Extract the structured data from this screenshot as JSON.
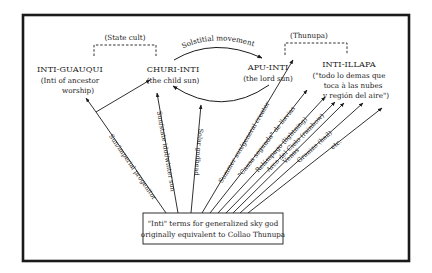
{
  "diagram": {
    "nodes": {
      "inti_guauqui": {
        "title": "INTI-GUAUQUI",
        "sub1": "(Inti of ancestor",
        "sub2": "worship)"
      },
      "churi_inti": {
        "title": "CHURI-INTI",
        "sub1": "(the child sun)"
      },
      "apu_inti": {
        "title": "APU-INTI",
        "sub1": "(the lord sun)"
      },
      "inti_illapa": {
        "title": "INTI-ILLAPA",
        "sub1": "(\"todo lo demas que",
        "sub2": "toca à las nubes",
        "sub3": "y región del aire\")"
      }
    },
    "brackets": {
      "state_cult": "(State cult)",
      "thunupa": "(Thunupa)"
    },
    "cycle_label": "Solstitial movement",
    "rays": [
      {
        "label": "Sun/imperial progenitor"
      },
      {
        "label": "Sun/state idol/winter sun"
      },
      {
        "label": "Solar godhead"
      },
      {
        "label": "Summer sun/general creator"
      },
      {
        "label": "\"Causa segunda\" de lluvias"
      },
      {
        "label": "Relámpago (lightning)"
      },
      {
        "label": "Arco del Cielo (rainbow)"
      },
      {
        "label": "Venus"
      },
      {
        "label": "Granizo (hail)"
      },
      {
        "label": "etc."
      }
    ],
    "base_box": {
      "line1": "\"Inti\" terms for generalized sky god",
      "line2": "originally equivalent to Collao Thunupa"
    }
  }
}
